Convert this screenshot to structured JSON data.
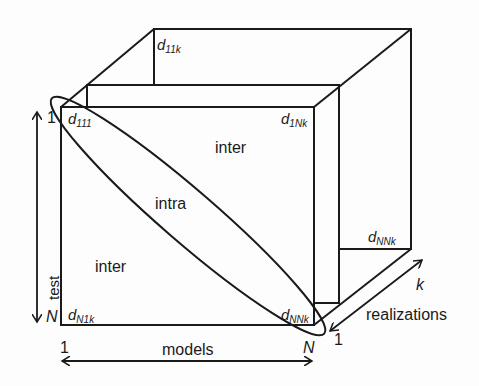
{
  "diagram": {
    "colors": {
      "stroke": "#1a1a1a",
      "background": "#fdfdfd"
    },
    "corner_labels": {
      "d111": {
        "base": "d",
        "sub": "111"
      },
      "d11k": {
        "base": "d",
        "sub": "11k"
      },
      "d1Nk": {
        "base": "d",
        "sub": "1Nk"
      },
      "dN1k": {
        "base": "d",
        "sub": "N1k"
      },
      "dNNk_front": {
        "base": "d",
        "sub": "NNk"
      },
      "dNNk_back": {
        "base": "d",
        "sub": "NNk"
      }
    },
    "regions": {
      "inter_upper": "inter",
      "intra": "intra",
      "inter_lower": "inter"
    },
    "axes": {
      "test": {
        "label": "test",
        "start": "1",
        "end": "N"
      },
      "models": {
        "label": "models",
        "start": "1",
        "end": "N"
      },
      "realizations": {
        "label": "realizations",
        "start": "1",
        "end": "k"
      }
    }
  }
}
